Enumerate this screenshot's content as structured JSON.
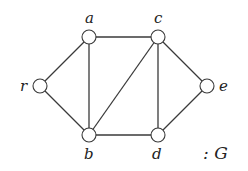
{
  "graph": {
    "name": "G",
    "caption": ": G",
    "colors": {
      "stroke": "#3a3a3a",
      "node_fill": "#ffffff",
      "text": "#222222"
    },
    "node_radius": 7,
    "nodes": [
      {
        "id": "r",
        "label": "r",
        "x": 40,
        "y": 86,
        "lx": 20,
        "ly": 91
      },
      {
        "id": "a",
        "label": "a",
        "x": 89,
        "y": 37,
        "lx": 85,
        "ly": 23
      },
      {
        "id": "c",
        "label": "c",
        "x": 158,
        "y": 37,
        "lx": 154,
        "ly": 23
      },
      {
        "id": "e",
        "label": "e",
        "x": 207,
        "y": 86,
        "lx": 219,
        "ly": 91
      },
      {
        "id": "b",
        "label": "b",
        "x": 89,
        "y": 135,
        "lx": 84,
        "ly": 159
      },
      {
        "id": "d",
        "label": "d",
        "x": 158,
        "y": 135,
        "lx": 152,
        "ly": 159
      }
    ],
    "edges": [
      [
        "r",
        "a"
      ],
      [
        "r",
        "b"
      ],
      [
        "a",
        "c"
      ],
      [
        "a",
        "b"
      ],
      [
        "c",
        "b"
      ],
      [
        "c",
        "d"
      ],
      [
        "c",
        "e"
      ],
      [
        "b",
        "d"
      ],
      [
        "d",
        "e"
      ]
    ]
  }
}
